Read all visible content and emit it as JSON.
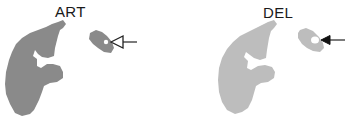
{
  "panels": [
    {
      "label": "ART",
      "tissue_color": "#8a8a8a",
      "spot_color": "#ffffff",
      "arrow_style": "open-head"
    },
    {
      "label": "DEL",
      "tissue_color": "#bdbdbd",
      "spot_color": "#ffffff",
      "arrow_style": "filled-head"
    }
  ]
}
